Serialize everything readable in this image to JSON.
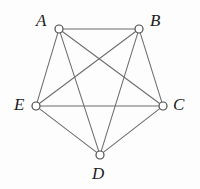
{
  "figure": {
    "kind": "graph-diagram",
    "width": 200,
    "height": 189,
    "background_color": "#fdfdfd",
    "edge_color": "#6d6d6d",
    "vertex_fill_color": "#ffffff",
    "vertex_stroke_color": "#4a4a4a",
    "label_color": "#1c1c1c"
  },
  "vertices": [
    {
      "id": "A",
      "label": "A",
      "cx": 59,
      "cy": 29,
      "r": 4.0,
      "label_x": 36,
      "label_y": 12
    },
    {
      "id": "B",
      "label": "B",
      "cx": 139,
      "cy": 29,
      "r": 4.0,
      "label_x": 150,
      "label_y": 12
    },
    {
      "id": "C",
      "label": "C",
      "cx": 163,
      "cy": 106,
      "r": 4.0,
      "label_x": 173,
      "label_y": 96
    },
    {
      "id": "D",
      "label": "D",
      "cx": 100,
      "cy": 155,
      "r": 4.0,
      "label_x": 92,
      "label_y": 165
    },
    {
      "id": "E",
      "label": "E",
      "cx": 36,
      "cy": 106,
      "r": 4.0,
      "label_x": 14,
      "label_y": 96
    }
  ],
  "edges": [
    {
      "id": "AB",
      "from": "A",
      "to": "B"
    },
    {
      "id": "AC",
      "from": "A",
      "to": "C"
    },
    {
      "id": "AD",
      "from": "A",
      "to": "D"
    },
    {
      "id": "AE",
      "from": "A",
      "to": "E"
    },
    {
      "id": "BC",
      "from": "B",
      "to": "C"
    },
    {
      "id": "BD",
      "from": "B",
      "to": "D"
    },
    {
      "id": "BE",
      "from": "B",
      "to": "E"
    },
    {
      "id": "CD",
      "from": "C",
      "to": "D"
    },
    {
      "id": "CE",
      "from": "C",
      "to": "E"
    },
    {
      "id": "DE",
      "from": "D",
      "to": "E"
    }
  ]
}
